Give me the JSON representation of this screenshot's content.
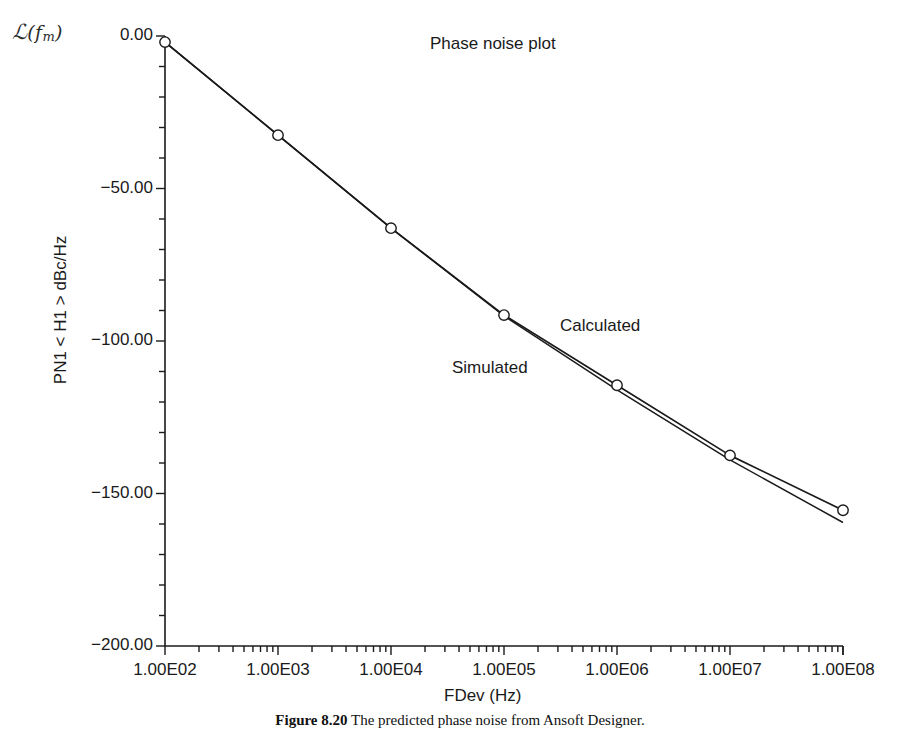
{
  "figure": {
    "corner_label": {
      "calligraphic_L": "ℒ",
      "open_paren": "(",
      "f": "f",
      "subscript": "m",
      "close_paren": ")"
    },
    "title": "Phase noise plot",
    "caption_prefix": "Figure 8.20",
    "caption_text": "The predicted phase noise from Ansoft Designer."
  },
  "annotations": [
    {
      "name": "calculated",
      "text": "Calculated",
      "x": 1900000.0,
      "y": -104
    },
    {
      "name": "simulated",
      "text": "Simulated",
      "x": 340000.0,
      "y": -118
    }
  ],
  "chart_data": {
    "type": "line",
    "title": "Phase noise plot",
    "xlabel": "FDev (Hz)",
    "ylabel": "PN1 < H1 > dBc/Hz",
    "xscale": "log",
    "xlim": [
      100,
      100000000
    ],
    "ylim": [
      -200,
      0
    ],
    "grid": false,
    "legend": "inline-annotations",
    "xticks": [
      100,
      1000,
      10000,
      100000,
      1000000,
      10000000,
      100000000
    ],
    "xtick_labels": [
      "1.00E02",
      "1.00E03",
      "1.00E04",
      "1.00E05",
      "1.00E06",
      "1.00E07",
      "1.00E08"
    ],
    "yticks": [
      0,
      -50,
      -100,
      -150,
      -200
    ],
    "ytick_labels": [
      "0.00",
      "-50.00",
      "-100.00",
      "-150.00",
      "-200.00"
    ],
    "y_minor_tick_step": 10,
    "series": [
      {
        "name": "Simulated",
        "markers": "open-circle",
        "x": [
          100,
          1000,
          10000,
          100000,
          1000000,
          10000000,
          100000000
        ],
        "values": [
          -2.0,
          -32.5,
          -63.0,
          -91.5,
          -114.5,
          -137.5,
          -155.5
        ]
      },
      {
        "name": "Calculated",
        "markers": "none",
        "x": [
          100,
          1000,
          10000,
          100000,
          1000000,
          10000000,
          100000000
        ],
        "values": [
          -2.0,
          -32.5,
          -63.0,
          -91.8,
          -116.0,
          -139.0,
          -159.5
        ]
      }
    ]
  },
  "axes": {
    "x_title": "FDev (Hz)",
    "y_title": "PN1 < H1 > dBc/Hz"
  }
}
